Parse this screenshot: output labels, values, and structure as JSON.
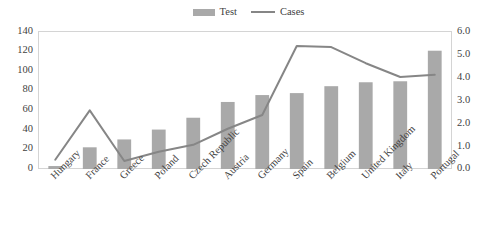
{
  "chart_data": {
    "type": "bar",
    "title": "",
    "subtitle": "",
    "xlabel": "",
    "ylabel": "",
    "categories": [
      "Hungary",
      "France",
      "Greece",
      "Poland",
      "Czech Republic",
      "Austria",
      "Germany",
      "Spain",
      "Belgium",
      "United Kingdom",
      "Italy",
      "Portugal"
    ],
    "series": [
      {
        "name": "Test",
        "type": "bar",
        "axis": "left",
        "color": "#a9a9a9",
        "values": [
          3,
          22,
          30,
          40,
          52,
          68,
          75,
          77,
          84,
          88,
          89,
          120
        ]
      },
      {
        "name": "Cases",
        "type": "line",
        "axis": "right",
        "color": "#868686",
        "values": [
          0.4,
          2.55,
          0.35,
          0.75,
          1.05,
          1.75,
          2.35,
          5.35,
          5.3,
          4.6,
          4.0,
          4.1
        ]
      }
    ],
    "left_axis": {
      "min": 0,
      "max": 140,
      "step": 20,
      "ticks": [
        "0",
        "20",
        "40",
        "60",
        "80",
        "100",
        "120",
        "140"
      ]
    },
    "right_axis": {
      "min": 0,
      "max": 6,
      "step": 1,
      "ticks": [
        "0.0",
        "1.0",
        "2.0",
        "3.0",
        "4.0",
        "5.0",
        "6.0"
      ]
    },
    "grid": false,
    "legend": {
      "position": "top-center",
      "entries": [
        {
          "label": "Test",
          "marker": "bar-swatch-icon",
          "color": "#a9a9a9"
        },
        {
          "label": "Cases",
          "marker": "line-swatch-icon",
          "color": "#868686"
        }
      ]
    }
  }
}
